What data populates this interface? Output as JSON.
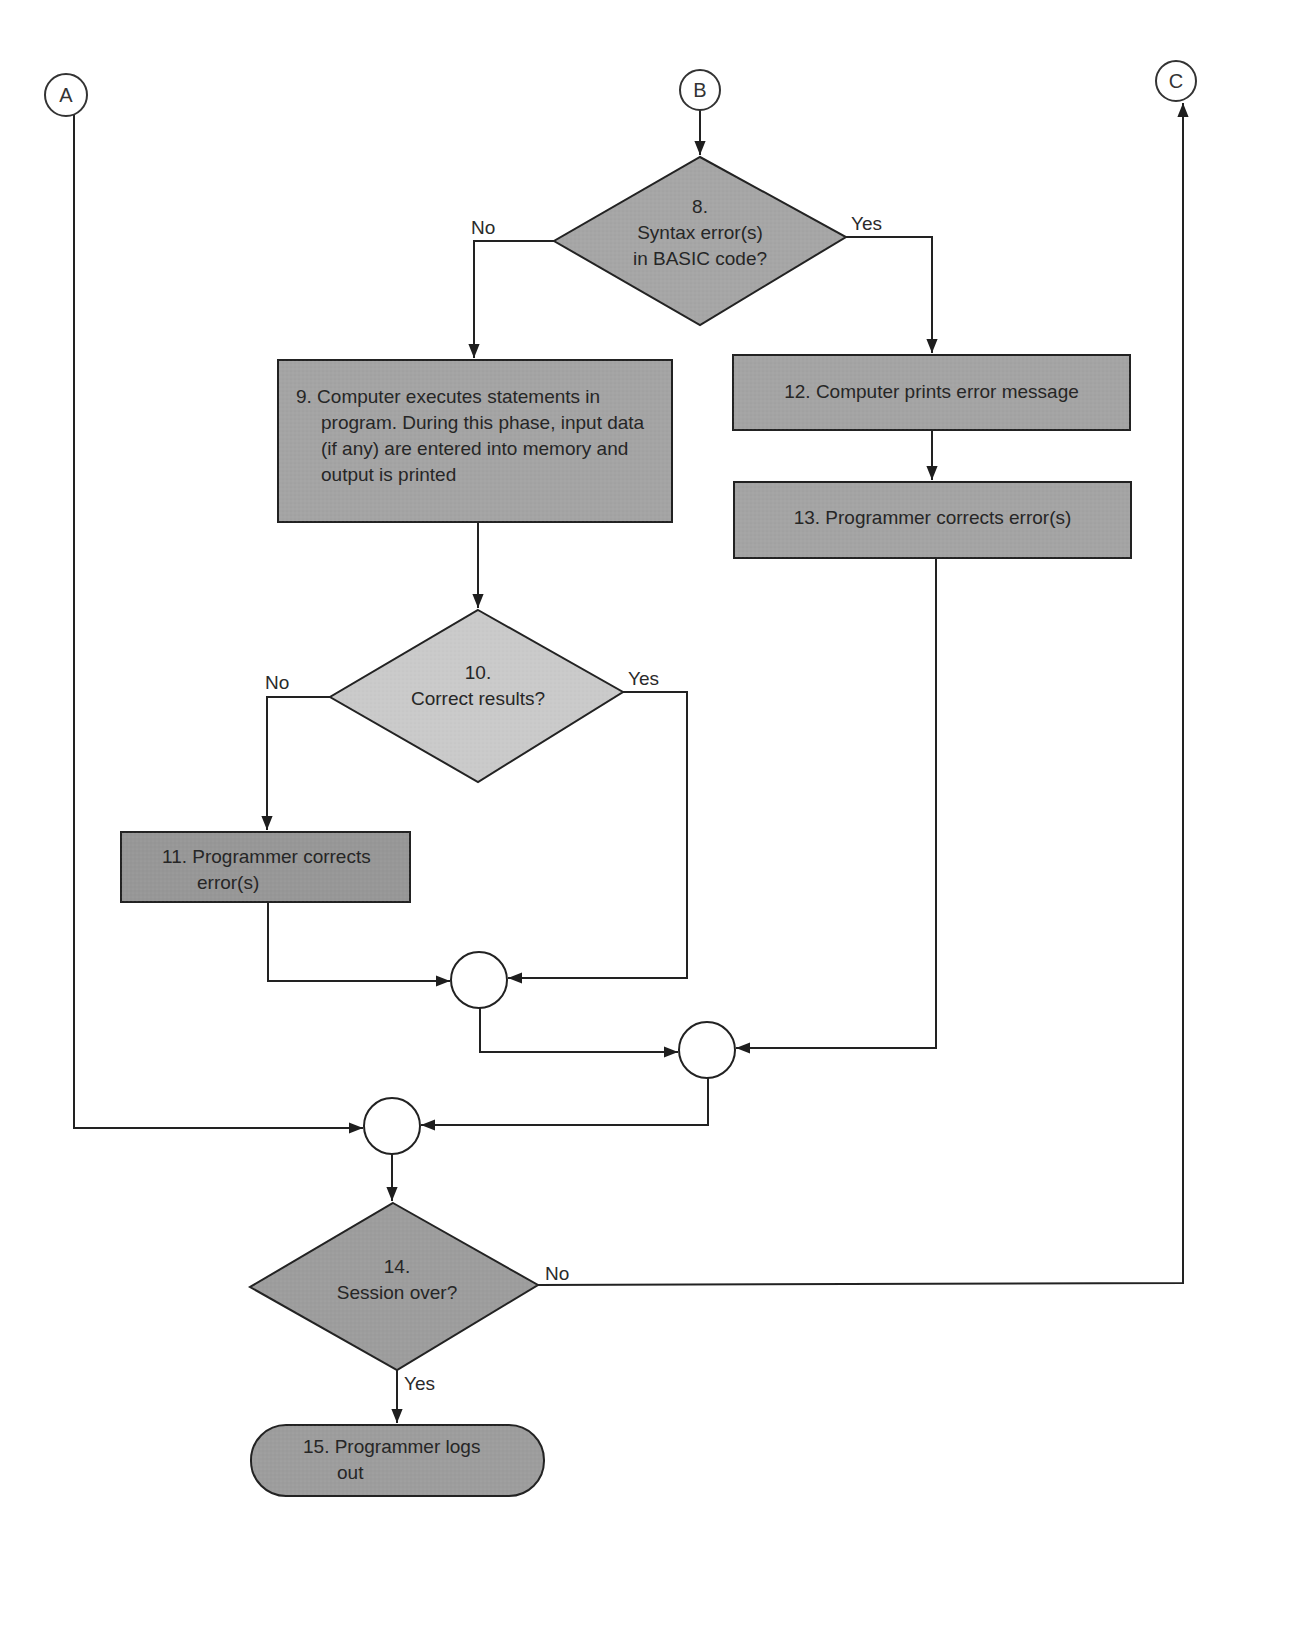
{
  "connectors": {
    "a": {
      "label": "A"
    },
    "b": {
      "label": "B"
    },
    "c": {
      "label": "C"
    }
  },
  "nodes": {
    "n8": {
      "number": "8.",
      "line1": "Syntax error(s)",
      "line2": "in BASIC code?",
      "shape": "decision"
    },
    "n9": {
      "lines": [
        "9. Computer executes statements in",
        "program. During this phase, input data",
        "(if any) are entered into memory and",
        "output is printed"
      ],
      "shape": "process"
    },
    "n10": {
      "number": "10.",
      "line1": "Correct results?",
      "shape": "decision"
    },
    "n11": {
      "lines": [
        "11. Programmer corrects",
        "error(s)"
      ],
      "shape": "process"
    },
    "n12": {
      "text": "12. Computer prints error message",
      "shape": "process"
    },
    "n13": {
      "text": "13. Programmer corrects error(s)",
      "shape": "process"
    },
    "n14": {
      "number": "14.",
      "line1": "Session over?",
      "shape": "decision"
    },
    "n15": {
      "lines": [
        "15. Programmer logs",
        "out"
      ],
      "shape": "terminal"
    }
  },
  "edge_labels": {
    "n8_no": "No",
    "n8_yes": "Yes",
    "n10_no": "No",
    "n10_yes": "Yes",
    "n14_no": "No",
    "n14_yes": "Yes"
  },
  "colors": {
    "dark_fill": "#9b9b9b",
    "mid_fill": "#a9a9a9",
    "light_fill": "#c9c9c9",
    "stroke": "#222222",
    "background": "#ffffff"
  }
}
